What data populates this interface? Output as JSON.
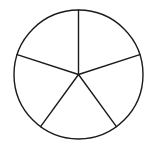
{
  "diagram": {
    "type": "circle-divided-into-equal-sectors",
    "sector_count": 5,
    "center": [
      78.5,
      74.5
    ],
    "radius": 64.5,
    "start_angle_deg": -90,
    "colors": {
      "stroke": "#1a1a1a",
      "fill": "#ffffff",
      "background": "#ffffff"
    }
  }
}
